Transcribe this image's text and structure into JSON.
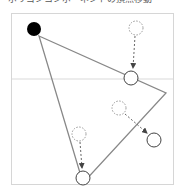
{
  "caption": "ポリゴンコンポーネントの頂点移動",
  "colors": {
    "frame": "#d6d6d6",
    "divider": "#d9d9d9",
    "polygon": "#888888",
    "handle_fill_active": "#000000",
    "handle_stroke": "#444444",
    "ghost_stroke": "#999999",
    "arrow": "#666666"
  },
  "diagram": {
    "divider_y": 79,
    "polygon": [
      [
        39,
        36
      ],
      [
        166,
        93
      ],
      [
        83,
        183
      ]
    ],
    "active_vertex": {
      "cx": 34,
      "cy": 29,
      "r": 7,
      "label": "selected-vertex"
    },
    "handles": [
      {
        "name": "moved-handle-edge-top",
        "cx": 131,
        "cy": 78,
        "r": 7
      },
      {
        "name": "moved-handle-right",
        "cx": 154,
        "cy": 140,
        "r": 7
      },
      {
        "name": "moved-handle-bottom",
        "cx": 83,
        "cy": 178,
        "r": 7
      }
    ],
    "ghosts": [
      {
        "name": "ghost-handle-top",
        "cx": 136,
        "cy": 28,
        "r": 7
      },
      {
        "name": "ghost-handle-middle",
        "cx": 119,
        "cy": 108,
        "r": 7
      },
      {
        "name": "ghost-handle-bottom",
        "cx": 79,
        "cy": 134,
        "r": 7
      }
    ],
    "arrows": [
      {
        "name": "move-arrow-top",
        "x1": 135,
        "y1": 36,
        "x2": 133,
        "y2": 68
      },
      {
        "name": "move-arrow-middle",
        "x1": 125,
        "y1": 114,
        "x2": 147,
        "y2": 133
      },
      {
        "name": "move-arrow-bottom",
        "x1": 80,
        "y1": 142,
        "x2": 82,
        "y2": 168
      }
    ]
  }
}
